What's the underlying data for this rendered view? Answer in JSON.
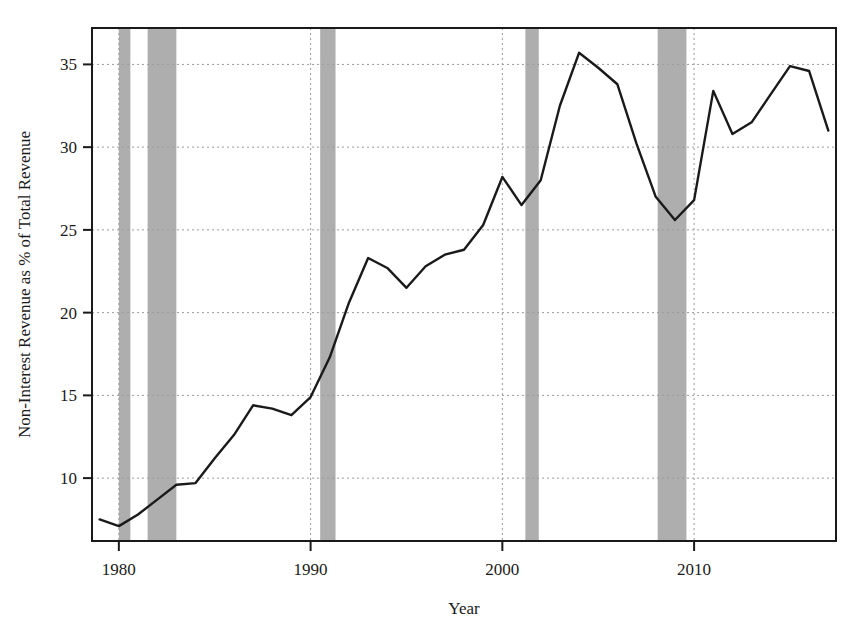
{
  "chart_data": {
    "type": "line",
    "title": "",
    "xlabel": "Year",
    "ylabel": "Non-Interest Revenue as % of Total Revenue",
    "xlim": [
      1978.6,
      2017.4
    ],
    "ylim": [
      6.2,
      37.2
    ],
    "xticks": [
      1980,
      1990,
      2000,
      2010
    ],
    "xtick_labels": [
      "1980",
      "1990",
      "2000",
      "2010"
    ],
    "yticks": [
      10,
      15,
      20,
      25,
      30,
      35
    ],
    "ytick_labels": [
      "10",
      "15",
      "20",
      "25",
      "30",
      "35"
    ],
    "grid": true,
    "legend": "none",
    "line_color": "#1a1a1a",
    "recession_color": "#aaaaaa",
    "x": [
      1979,
      1980,
      1981,
      1982,
      1983,
      1984,
      1985,
      1986,
      1987,
      1988,
      1989,
      1990,
      1991,
      1992,
      1993,
      1994,
      1995,
      1996,
      1997,
      1998,
      1999,
      2000,
      2001,
      2002,
      2003,
      2004,
      2005,
      2006,
      2007,
      2008,
      2009,
      2010,
      2011,
      2012,
      2013,
      2014,
      2015,
      2016,
      2017
    ],
    "values": [
      7.5,
      7.1,
      7.8,
      8.7,
      9.6,
      9.7,
      11.2,
      12.6,
      14.4,
      14.2,
      13.8,
      14.9,
      17.3,
      20.6,
      23.3,
      22.7,
      21.5,
      22.8,
      23.5,
      23.8,
      25.3,
      28.2,
      26.5,
      28.0,
      32.5,
      35.7,
      34.8,
      33.8,
      30.2,
      27.0,
      25.6,
      26.8,
      33.4,
      30.8,
      31.5,
      33.2,
      34.9,
      34.6,
      31.0
    ],
    "recessions": [
      {
        "label": "1980 recession",
        "start": 1980.0,
        "end": 1980.6
      },
      {
        "label": "1981-82 recession",
        "start": 1981.5,
        "end": 1983.0
      },
      {
        "label": "1990-91 recession",
        "start": 1990.5,
        "end": 1991.3
      },
      {
        "label": "2001 recession",
        "start": 2001.2,
        "end": 2001.9
      },
      {
        "label": "2007-09 recession",
        "start": 2008.1,
        "end": 2009.6
      }
    ],
    "annotations": []
  }
}
